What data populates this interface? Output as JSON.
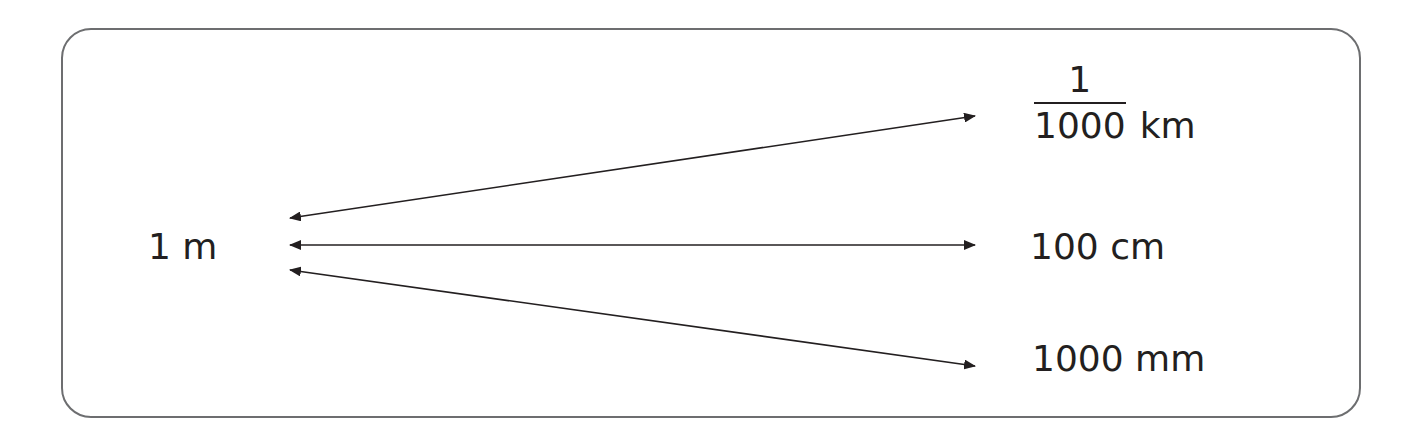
{
  "diagram": {
    "type": "unit-equivalence",
    "source": {
      "label": "1 m"
    },
    "targets": [
      {
        "numerator": "1",
        "denominator": "1000",
        "unit": "km"
      },
      {
        "label": "100 cm"
      },
      {
        "label": "1000 mm"
      }
    ],
    "colors": {
      "border": "#6d6e70",
      "text": "#231f20",
      "arrow": "#231f20"
    }
  }
}
